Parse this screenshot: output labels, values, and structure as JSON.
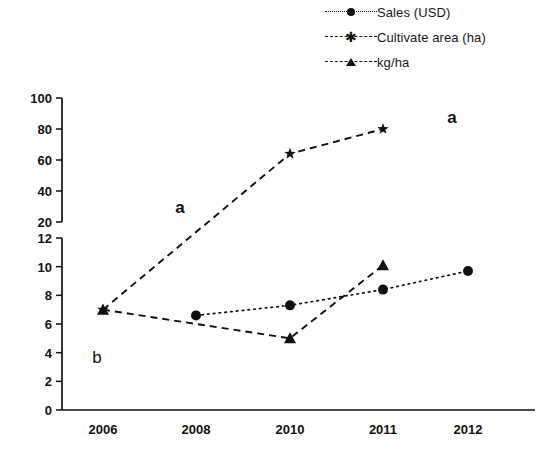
{
  "chart_data": {
    "type": "line",
    "title": "",
    "xlabel": "",
    "ylabel": "",
    "grid": false,
    "legend_position": "top-right",
    "broken_axis": true,
    "categories": [
      "2006",
      "2008",
      "2010",
      "2011",
      "2012"
    ],
    "axes": {
      "lower": {
        "ylim": [
          0,
          12
        ],
        "ticks": [
          0,
          2,
          4,
          6,
          8,
          10,
          12
        ]
      },
      "upper": {
        "ylim": [
          20,
          100
        ],
        "ticks": [
          20,
          40,
          60,
          80,
          100
        ]
      }
    },
    "series": [
      {
        "name": "Sales (USD)",
        "marker": "circle",
        "line_style": "dotted",
        "panel": "lower",
        "x": [
          "2008",
          "2010",
          "2011",
          "2012"
        ],
        "values": [
          6.6,
          7.3,
          8.4,
          9.7
        ]
      },
      {
        "name": "Cultivate area (ha)",
        "marker": "star",
        "line_style": "dashed",
        "panel": "split",
        "x": [
          "2006",
          "2010",
          "2011"
        ],
        "values": [
          7.0,
          64,
          80
        ]
      },
      {
        "name": "kg/ha",
        "marker": "triangle",
        "line_style": "dashed",
        "panel": "lower",
        "x": [
          "2006",
          "2010",
          "2011"
        ],
        "values": [
          7.0,
          5.0,
          10.1
        ]
      }
    ],
    "annotations": [
      {
        "text": "a",
        "x_px": 180,
        "y_px": 213,
        "weight": "bold"
      },
      {
        "text": "a",
        "x_px": 452,
        "y_px": 123,
        "weight": "bold"
      },
      {
        "text": "b",
        "x_px": 97,
        "y_px": 363,
        "weight": "normal"
      }
    ]
  },
  "legend": {
    "items": [
      {
        "label": "Sales (USD)",
        "icon": "circle-marker-dotted-line-icon"
      },
      {
        "label": "Cultivate area (ha)",
        "icon": "star-marker-dashed-line-icon"
      },
      {
        "label": "kg/ha",
        "icon": "triangle-marker-dashed-line-icon"
      }
    ]
  },
  "axis_labels": {
    "upper_ticks": [
      "100",
      "80",
      "60",
      "40",
      "20"
    ],
    "lower_ticks": [
      "12",
      "10",
      "8",
      "6",
      "4",
      "2",
      "0"
    ],
    "x_ticks": [
      "2006",
      "2008",
      "2010",
      "2011",
      "2012"
    ]
  },
  "colors": {
    "ink": "#111111",
    "background": "#ffffff"
  }
}
